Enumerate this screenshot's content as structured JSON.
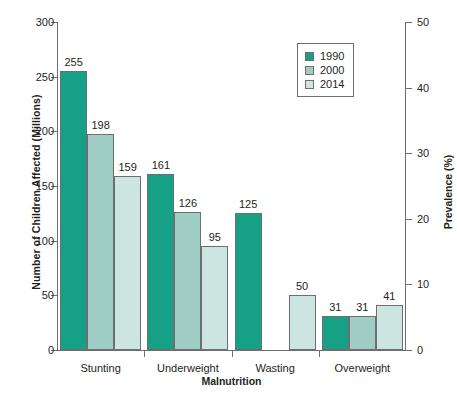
{
  "chart_data": {
    "type": "bar",
    "title": "",
    "xlabel": "Malnutrition",
    "ylabel": "Number of Children Affected (Millions)",
    "ylabel_secondary": "Prevalence (%)",
    "categories": [
      "Stunting",
      "Underweight",
      "Wasting",
      "Overweight"
    ],
    "series": [
      {
        "name": "1990",
        "color": "#16a085",
        "values": [
          255,
          161,
          125,
          31
        ]
      },
      {
        "name": "2000",
        "color": "#9fcdc4",
        "values": [
          198,
          126,
          null,
          31
        ]
      },
      {
        "name": "2014",
        "color": "#cde5e0",
        "values": [
          159,
          95,
          50,
          41
        ]
      }
    ],
    "ylim": [
      0,
      300
    ],
    "yticks": [
      0,
      50,
      100,
      150,
      200,
      250,
      300
    ],
    "ylim_secondary": [
      0,
      50
    ],
    "yticks_secondary": [
      0,
      10,
      20,
      30,
      40,
      50
    ],
    "grid": false,
    "legend_position": "top-right",
    "bar_labels": [
      {
        "category": "Stunting",
        "series": "1990",
        "value": 255
      },
      {
        "category": "Stunting",
        "series": "2000",
        "value": 198
      },
      {
        "category": "Stunting",
        "series": "2014",
        "value": 159
      },
      {
        "category": "Underweight",
        "series": "1990",
        "value": 161
      },
      {
        "category": "Underweight",
        "series": "2000",
        "value": 126
      },
      {
        "category": "Underweight",
        "series": "2014",
        "value": 95
      },
      {
        "category": "Wasting",
        "series": "1990",
        "value": 125
      },
      {
        "category": "Wasting",
        "series": "2014",
        "value": 50
      },
      {
        "category": "Overweight",
        "series": "1990",
        "value": 31
      },
      {
        "category": "Overweight",
        "series": "2000",
        "value": 31
      },
      {
        "category": "Overweight",
        "series": "2014",
        "value": 41
      }
    ]
  },
  "legend": {
    "items": [
      {
        "label": "1990",
        "color": "#16a085"
      },
      {
        "label": "2000",
        "color": "#9fcdc4"
      },
      {
        "label": "2014",
        "color": "#cde5e0"
      }
    ]
  },
  "axes": {
    "left_ticks": [
      "300",
      "250",
      "200",
      "150",
      "100",
      "50",
      "0"
    ],
    "right_ticks": [
      "50",
      "40",
      "30",
      "20",
      "10",
      "0"
    ]
  }
}
